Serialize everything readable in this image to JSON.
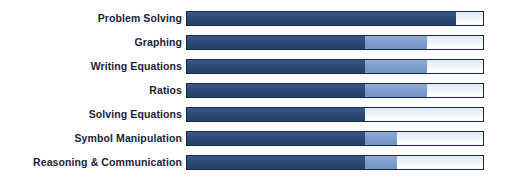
{
  "chart_data": {
    "type": "bar",
    "title": "",
    "xlabel": "",
    "ylabel": "",
    "orientation": "horizontal",
    "stacked": true,
    "grid": false,
    "legend_position": "none",
    "xlim": [
      0,
      100
    ],
    "axis_labels_visible": false,
    "categories": [
      "Problem Solving",
      "Graphing",
      "Writing Equations",
      "Ratios",
      "Solving Equations",
      "Symbol Manipulation",
      "Reasoning & Communication"
    ],
    "series": [
      {
        "name": "dark-blue",
        "color": "#2c4a77",
        "values": [
          91,
          60,
          60,
          60,
          60,
          60,
          60
        ]
      },
      {
        "name": "medium-blue",
        "color": "#7e9ecb",
        "values": [
          0,
          21,
          21,
          21,
          0,
          11,
          11
        ]
      },
      {
        "name": "light",
        "color": "#eef3fa",
        "values": [
          9,
          19,
          19,
          19,
          40,
          29,
          29
        ]
      }
    ],
    "colors": {
      "dark": "#2c4a77",
      "medium": "#7e9ecb",
      "light": "#eef3fa",
      "border": "#1b2a44",
      "label_text": "#1a2436",
      "background": "#ffffff"
    }
  }
}
